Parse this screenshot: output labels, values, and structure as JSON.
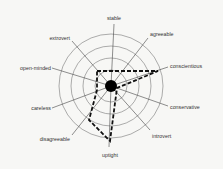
{
  "chart_data": {
    "type": "radar",
    "title": "",
    "center": [
      111,
      86
    ],
    "ring_radii": [
      16,
      28,
      40,
      52
    ],
    "axes": [
      {
        "label": "stable",
        "end": [
          114,
          24
        ],
        "text_pos": [
          114,
          20
        ],
        "anchor": "middle"
      },
      {
        "label": "agreeable",
        "end": [
          148,
          38
        ],
        "text_pos": [
          150,
          36
        ],
        "anchor": "start"
      },
      {
        "label": "conscientious",
        "end": [
          168,
          67
        ],
        "text_pos": [
          170,
          68
        ],
        "anchor": "start"
      },
      {
        "label": "conservative",
        "end": [
          168,
          106
        ],
        "text_pos": [
          170,
          109
        ],
        "anchor": "start"
      },
      {
        "label": "introvert",
        "end": [
          150,
          130
        ],
        "text_pos": [
          152,
          138
        ],
        "anchor": "start"
      },
      {
        "label": "uptight",
        "end": [
          109,
          147
        ],
        "text_pos": [
          110,
          157
        ],
        "anchor": "middle"
      },
      {
        "label": "disagreeable",
        "end": [
          72,
          135
        ],
        "text_pos": [
          70,
          141
        ],
        "anchor": "end"
      },
      {
        "label": "careless",
        "end": [
          52,
          108
        ],
        "text_pos": [
          51,
          110
        ],
        "anchor": "end"
      },
      {
        "label": "open-minded",
        "end": [
          52,
          68
        ],
        "text_pos": [
          51,
          70
        ],
        "anchor": "end"
      },
      {
        "label": "extrovert",
        "end": [
          72,
          41
        ],
        "text_pos": [
          70,
          40
        ],
        "anchor": "end"
      }
    ],
    "profile_polygon": [
      [
        97,
        71
      ],
      [
        158,
        71
      ],
      [
        117,
        88
      ],
      [
        110,
        141
      ],
      [
        89,
        120
      ],
      [
        97,
        90
      ]
    ],
    "legend": null
  },
  "colors": {
    "background": "#f7f7f5",
    "rings": "#777777",
    "spokes": "#444444",
    "polygon": "#111111",
    "center_dot": "#000000"
  }
}
